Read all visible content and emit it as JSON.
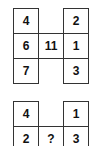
{
  "puzzle": {
    "example": {
      "top_left": "4",
      "top_right": "2",
      "mid_left": "6",
      "center": "11",
      "mid_right": "1",
      "bottom_left": "7",
      "bottom_right": "3"
    },
    "question": {
      "top_left": "4",
      "top_right": "1",
      "mid_left": "2",
      "center": "?",
      "mid_right": "3"
    }
  }
}
